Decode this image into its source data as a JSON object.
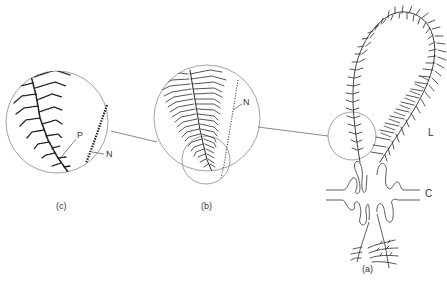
{
  "figure": {
    "panels": [
      {
        "id": "c",
        "caption": "(c)",
        "labels": [
          "P",
          "N"
        ]
      },
      {
        "id": "b",
        "caption": "(b)",
        "labels": [
          "N"
        ]
      },
      {
        "id": "a",
        "caption": "(a)",
        "labels": [
          "L",
          "C"
        ]
      }
    ],
    "labels": {
      "c_caption": "(c)",
      "b_caption": "(b)",
      "a_caption": "(a)",
      "c_P": "P",
      "c_N": "N",
      "b_N": "N",
      "a_L": "L",
      "a_C": "C"
    },
    "colors": {
      "ink": "#2a2a2a",
      "circle": "#7a7a7a",
      "background": "#ffffff"
    }
  }
}
